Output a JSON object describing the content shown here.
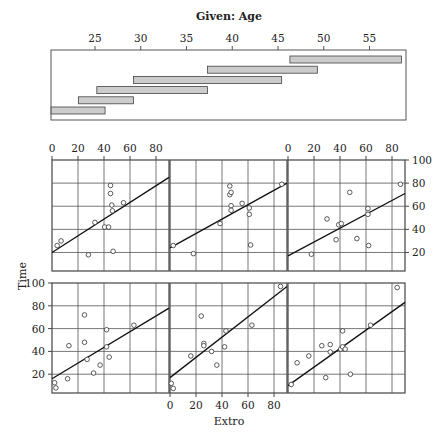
{
  "chart_data": {
    "type": "scatter",
    "given": {
      "title": "Given: Age",
      "ticks": [
        25,
        30,
        35,
        40,
        45,
        50,
        55
      ],
      "range": [
        20,
        59
      ],
      "intervals": [
        [
          20.2,
          26.1
        ],
        [
          23.2,
          29.2
        ],
        [
          25.2,
          37.3
        ],
        [
          29.2,
          45.4
        ],
        [
          37.3,
          49.3
        ],
        [
          46.3,
          58.5
        ]
      ],
      "bar_color": "#cccccc"
    },
    "xlabel": "Extro",
    "ylabel": "Time",
    "xticks": [
      0,
      20,
      40,
      60,
      80
    ],
    "yticks": [
      20,
      40,
      60,
      80,
      100
    ],
    "xlim": [
      0,
      90
    ],
    "ylim": [
      4,
      100
    ],
    "grid": true,
    "panels": [
      {
        "interval_index": 0,
        "row": "bottom",
        "col": 0,
        "points": [
          [
            2,
            12.5
          ],
          [
            3,
            8
          ],
          [
            12,
            16
          ],
          [
            13,
            45
          ],
          [
            25,
            72
          ],
          [
            25,
            48
          ],
          [
            27,
            33
          ],
          [
            32,
            21
          ],
          [
            37,
            28
          ],
          [
            42,
            59
          ],
          [
            42,
            44
          ],
          [
            44,
            35
          ],
          [
            63,
            63
          ]
        ],
        "fit": [
          [
            0,
            16
          ],
          [
            90,
            78
          ]
        ]
      },
      {
        "interval_index": 1,
        "row": "bottom",
        "col": 1,
        "points": [
          [
            1,
            12
          ],
          [
            2.5,
            7.5
          ],
          [
            16,
            36
          ],
          [
            24,
            71
          ],
          [
            26,
            47
          ],
          [
            26,
            45
          ],
          [
            32,
            40
          ],
          [
            36,
            28
          ],
          [
            42,
            44
          ],
          [
            43,
            58
          ],
          [
            63,
            63
          ],
          [
            85,
            97
          ]
        ],
        "fit": [
          [
            0,
            17
          ],
          [
            90,
            97
          ]
        ]
      },
      {
        "interval_index": 2,
        "row": "bottom",
        "col": 2,
        "points": [
          [
            2.5,
            11
          ],
          [
            7,
            30
          ],
          [
            16,
            36
          ],
          [
            26,
            45
          ],
          [
            29,
            17
          ],
          [
            32.5,
            46
          ],
          [
            32.5,
            39.5
          ],
          [
            40.5,
            42
          ],
          [
            42,
            58
          ],
          [
            42,
            44
          ],
          [
            44,
            42
          ],
          [
            48,
            20
          ],
          [
            63.5,
            63
          ],
          [
            84,
            96
          ]
        ],
        "fit": [
          [
            0,
            10
          ],
          [
            90,
            83
          ]
        ]
      },
      {
        "interval_index": 3,
        "row": "top",
        "col": 0,
        "points": [
          [
            4,
            26
          ],
          [
            7,
            30
          ],
          [
            28,
            18
          ],
          [
            33,
            46
          ],
          [
            40.5,
            42
          ],
          [
            43.5,
            42
          ],
          [
            45,
            78
          ],
          [
            45,
            71
          ],
          [
            46,
            61
          ],
          [
            46.5,
            56
          ],
          [
            47,
            21
          ],
          [
            55,
            63
          ]
        ],
        "fit": [
          [
            0,
            20
          ],
          [
            90,
            85
          ]
        ]
      },
      {
        "interval_index": 4,
        "row": "top",
        "col": 1,
        "points": [
          [
            2.5,
            26
          ],
          [
            18,
            19
          ],
          [
            38.5,
            45
          ],
          [
            46,
            77.5
          ],
          [
            46,
            70
          ],
          [
            47,
            72
          ],
          [
            47,
            60.5
          ],
          [
            47,
            56.5
          ],
          [
            55.5,
            62.5
          ],
          [
            61,
            58.5
          ],
          [
            61,
            53
          ],
          [
            62,
            26.5
          ],
          [
            86,
            79
          ]
        ],
        "fit": [
          [
            0,
            24
          ],
          [
            90,
            80
          ]
        ]
      },
      {
        "interval_index": 5,
        "row": "top",
        "col": 2,
        "points": [
          [
            18,
            18.5
          ],
          [
            30,
            49
          ],
          [
            37,
            31
          ],
          [
            39,
            44
          ],
          [
            41,
            45
          ],
          [
            47.5,
            72
          ],
          [
            53,
            32
          ],
          [
            61.5,
            58
          ],
          [
            61.5,
            53
          ],
          [
            62,
            26
          ],
          [
            86.5,
            79
          ]
        ],
        "fit": [
          [
            0,
            17
          ],
          [
            90,
            71
          ]
        ]
      }
    ],
    "axis_placement": {
      "top_x_ticks_on_cols": [
        0,
        2
      ],
      "bottom_x_ticks_on_cols": [
        1
      ],
      "right_y_ticks_on_row": "top",
      "left_y_ticks_on_row": "bottom"
    }
  }
}
